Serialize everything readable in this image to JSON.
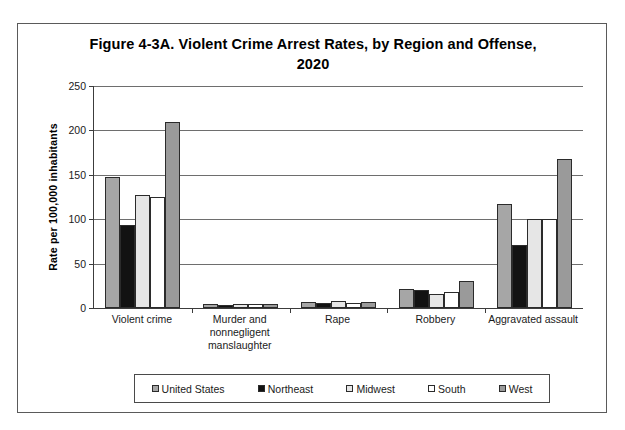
{
  "figure": {
    "title": "Figure 4-3A. Violent Crime Arrest Rates, by Region and Offense, 2020"
  },
  "chart_data": {
    "type": "bar",
    "title": "Figure 4-3A. Violent Crime Arrest Rates, by Region and Offense, 2020",
    "xlabel": "",
    "ylabel": "Rate per 100,000 inhabitants",
    "ylim": [
      0,
      250
    ],
    "yticks": [
      0,
      50,
      100,
      150,
      200,
      250
    ],
    "ytick_labels": [
      "0",
      "50",
      "100",
      "150",
      "200",
      "250"
    ],
    "grid": true,
    "legend_position": "bottom",
    "categories": [
      "Violent crime",
      "Murder and nonnegligent manslaughter",
      "Rape",
      "Robbery",
      "Aggravated assault"
    ],
    "series": [
      {
        "name": "United States",
        "color": "#a6a6a6",
        "values": [
          148,
          4,
          7,
          21,
          117
        ]
      },
      {
        "name": "Northeast",
        "color": "#121212",
        "values": [
          93,
          3,
          6,
          20,
          71
        ]
      },
      {
        "name": "Midwest",
        "color": "#e6e6e6",
        "values": [
          127,
          4,
          8,
          16,
          100
        ]
      },
      {
        "name": "South",
        "color": "#ffffff",
        "values": [
          125,
          4,
          6,
          18,
          100
        ]
      },
      {
        "name": "West",
        "color": "#9a9a9a",
        "values": [
          210,
          4,
          7,
          30,
          168
        ]
      }
    ]
  }
}
